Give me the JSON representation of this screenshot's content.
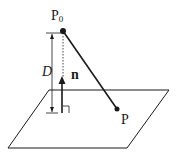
{
  "diagram": {
    "title": "",
    "labels": {
      "point_p0_base": "P",
      "point_p0_sub": "0",
      "point_p": "P",
      "distance": "D",
      "normal": "n"
    },
    "colors": {
      "stroke": "#1a1a1a",
      "background": "#ffffff"
    },
    "elements": {
      "plane": "parallelogram",
      "segment": "P0 to P",
      "normal_vector": "n",
      "distance_dimension": "D",
      "right_angle_marker": true,
      "perpendicular_dotted_line": true
    }
  }
}
